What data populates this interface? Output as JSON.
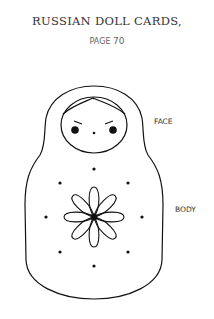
{
  "header": {
    "title": "RUSSIAN DOLL CARDS,",
    "page_prefix": "PAGE",
    "page_number": "70"
  },
  "labels": {
    "face": "FACE",
    "body": "BODY"
  },
  "illustration": {
    "subject": "russian-doll-outline",
    "line_color": "#111111"
  }
}
